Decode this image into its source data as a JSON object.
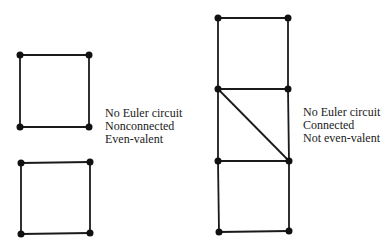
{
  "figures": [
    {
      "id": "left",
      "description": "Two disjoint squares",
      "labels": [
        "No Euler circuit",
        "Nonconnected",
        "Even-valent"
      ],
      "vertices": [
        [
          20,
          55
        ],
        [
          89,
          55
        ],
        [
          20,
          127
        ],
        [
          89,
          127
        ],
        [
          21,
          163
        ],
        [
          90,
          162
        ],
        [
          21,
          234
        ],
        [
          90,
          233
        ]
      ],
      "edges": [
        [
          0,
          1
        ],
        [
          1,
          3
        ],
        [
          3,
          2
        ],
        [
          2,
          0
        ],
        [
          4,
          5
        ],
        [
          5,
          7
        ],
        [
          7,
          6
        ],
        [
          6,
          4
        ]
      ]
    },
    {
      "id": "right",
      "description": "Three stacked squares with a diagonal in the middle square",
      "labels": [
        "No Euler circuit",
        "Connected",
        "Not even-valent"
      ],
      "vertices": [
        [
          218,
          18
        ],
        [
          288,
          18
        ],
        [
          218,
          89
        ],
        [
          288,
          89
        ],
        [
          218,
          161
        ],
        [
          289,
          161
        ],
        [
          219,
          232
        ],
        [
          289,
          231
        ]
      ],
      "edges": [
        [
          0,
          1
        ],
        [
          0,
          2
        ],
        [
          1,
          3
        ],
        [
          2,
          3
        ],
        [
          2,
          4
        ],
        [
          3,
          5
        ],
        [
          2,
          5
        ],
        [
          4,
          5
        ],
        [
          4,
          6
        ],
        [
          5,
          7
        ],
        [
          6,
          7
        ]
      ]
    }
  ],
  "style": {
    "edge_color": "#1a1a1a",
    "vertex_color": "#111111",
    "vertex_radius": 3.5,
    "edge_width": 1.8
  }
}
